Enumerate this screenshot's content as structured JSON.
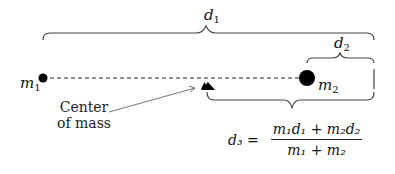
{
  "diagram": {
    "labels": {
      "d1": {
        "base": "d",
        "sub": "1"
      },
      "d2": {
        "base": "d",
        "sub": "2"
      },
      "m1": {
        "base": "m",
        "sub": "1"
      },
      "m2": {
        "base": "m",
        "sub": "2"
      }
    },
    "annotation": {
      "line1": "Center",
      "line2": "of mass"
    },
    "formula": {
      "lhs": "d₃ =",
      "numerator": "m₁d₁ + m₂d₂",
      "denominator": "m₁ + m₂"
    },
    "colors": {
      "ink": "#111111",
      "brace": "#444444"
    }
  }
}
